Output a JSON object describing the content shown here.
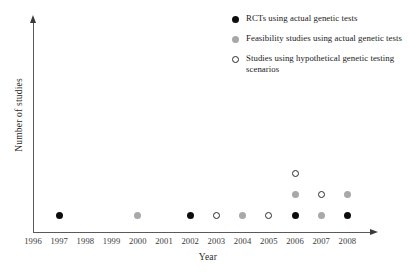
{
  "chart_data": {
    "type": "scatter",
    "title": "",
    "xlabel": "Year",
    "ylabel": "Number of studies",
    "grid": false,
    "legend_position": "top-right",
    "xlim": [
      1996,
      2008
    ],
    "x_ticks": [
      "1996",
      "1997",
      "1998",
      "1999",
      "2000",
      "2001",
      "2002",
      "2003",
      "2004",
      "2005",
      "2006",
      "2007",
      "2008"
    ],
    "y_ticks": [],
    "categories": [
      1996,
      1997,
      1998,
      1999,
      2000,
      2001,
      2002,
      2003,
      2004,
      2005,
      2006,
      2007,
      2008
    ],
    "series": [
      {
        "name": "RCTs using actual genetic tests",
        "marker": "filled",
        "color": "#0d0d0d",
        "points": [
          {
            "year": 1997,
            "count": 1
          },
          {
            "year": 2002,
            "count": 1
          },
          {
            "year": 2006,
            "count": 1
          },
          {
            "year": 2008,
            "count": 1
          }
        ]
      },
      {
        "name": "Feasibility studies using actual genetic tests",
        "marker": "gray",
        "color": "#a8a8a8",
        "points": [
          {
            "year": 2000,
            "count": 1
          },
          {
            "year": 2004,
            "count": 1
          },
          {
            "year": 2006,
            "count": 1
          },
          {
            "year": 2007,
            "count": 1
          },
          {
            "year": 2008,
            "count": 1
          }
        ]
      },
      {
        "name": "Studies using hypothetical genetic testing scenarios",
        "marker": "open",
        "color": "#ffffff",
        "points": [
          {
            "year": 2003,
            "count": 1
          },
          {
            "year": 2005,
            "count": 1
          },
          {
            "year": 2006,
            "count": 1
          },
          {
            "year": 2007,
            "count": 1
          }
        ]
      }
    ],
    "stacks": [
      {
        "year": 1997,
        "markers": [
          "filled"
        ]
      },
      {
        "year": 2000,
        "markers": [
          "gray"
        ]
      },
      {
        "year": 2002,
        "markers": [
          "filled"
        ]
      },
      {
        "year": 2003,
        "markers": [
          "open"
        ]
      },
      {
        "year": 2004,
        "markers": [
          "gray"
        ]
      },
      {
        "year": 2005,
        "markers": [
          "open"
        ]
      },
      {
        "year": 2006,
        "markers": [
          "filled",
          "gray",
          "open"
        ]
      },
      {
        "year": 2007,
        "markers": [
          "gray",
          "open"
        ]
      },
      {
        "year": 2008,
        "markers": [
          "filled",
          "gray"
        ]
      }
    ]
  },
  "axes": {
    "x_title": "Year",
    "y_title": "Number of studies"
  },
  "legend": {
    "items": [
      {
        "marker": "filled",
        "label": "RCTs using actual genetic tests"
      },
      {
        "marker": "gray",
        "label": "Feasibility studies using actual genetic tests"
      },
      {
        "marker": "open",
        "label": "Studies using hypothetical genetic testing scenarios"
      }
    ]
  }
}
